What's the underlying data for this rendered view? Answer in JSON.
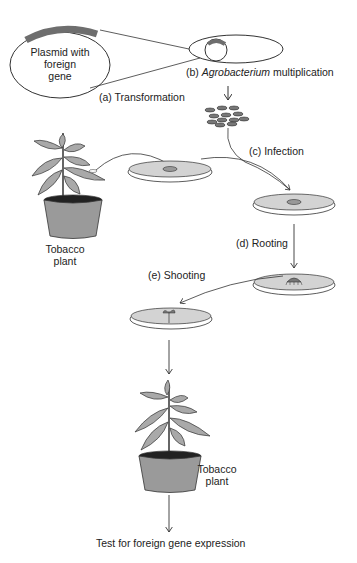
{
  "diagram": {
    "title": "",
    "plasmid": {
      "label_line1": "Plasmid with",
      "label_line2": "foreign",
      "label_line3": "gene"
    },
    "steps": {
      "a": {
        "prefix": "(a)",
        "label": "Transformation"
      },
      "b": {
        "prefix": "(b)",
        "label_italic": "Agrobacterium",
        "label_rest": "multiplication"
      },
      "c": {
        "prefix": "(c)",
        "label": "Infection"
      },
      "d": {
        "prefix": "(d)",
        "label": "Rooting"
      },
      "e": {
        "prefix": "(e)",
        "label": "Shooting"
      }
    },
    "plant_top": {
      "line1": "Tobacco",
      "line2": "plant"
    },
    "plant_bottom": {
      "line1": "Tobacco",
      "line2": "plant"
    },
    "final": {
      "label": "Test for foreign gene expression"
    },
    "colors": {
      "stroke": "#333333",
      "fill_gray": "#a9a9a9",
      "dish_fill": "#d3d3d3",
      "soil": "#222222",
      "gene_band": "#6e6e6e"
    }
  }
}
